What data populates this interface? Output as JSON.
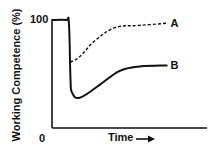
{
  "chart_data": {
    "type": "line",
    "title": "",
    "xlabel": "Time",
    "ylabel": "Working Competence (%)",
    "xlim": [
      0,
      100
    ],
    "ylim": [
      0,
      100
    ],
    "y_tick_labels": [
      "0",
      "100"
    ],
    "grid": false,
    "x_axis_arrow": true,
    "series": [
      {
        "name": "A",
        "style": "dashed",
        "x": [
          12,
          18,
          28,
          41,
          57,
          75
        ],
        "y": [
          61,
          66,
          81,
          93,
          95,
          97
        ]
      },
      {
        "name": "B",
        "style": "solid",
        "x": [
          0,
          9,
          11,
          12,
          13,
          18,
          31,
          44,
          57,
          75
        ],
        "y": [
          100,
          100,
          97,
          45,
          33,
          28,
          40,
          53,
          57,
          58
        ]
      }
    ]
  }
}
